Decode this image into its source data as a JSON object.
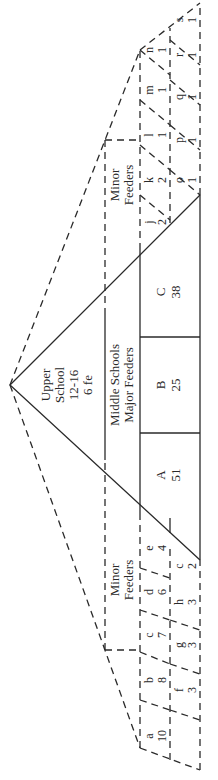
{
  "diagram": {
    "upper_school": {
      "lines": [
        "Upper",
        "School",
        "12-16",
        "6 fe"
      ]
    },
    "middle_schools": {
      "lines": [
        "Middle Schools",
        "Major Feeders"
      ],
      "feeders": [
        {
          "letter": "A",
          "value": "51"
        },
        {
          "letter": "B",
          "value": "25"
        },
        {
          "letter": "C",
          "value": "38"
        }
      ]
    },
    "minor_feeders_left": {
      "label_lines": [
        "Minor",
        "Feeders"
      ],
      "top_row": [
        {
          "letter": "a",
          "value": "10"
        },
        {
          "letter": "b",
          "value": "8"
        },
        {
          "letter": "c",
          "value": "7"
        },
        {
          "letter": "d",
          "value": "6"
        },
        {
          "letter": "e",
          "value": "4"
        }
      ],
      "bottom_row": [
        {
          "letter": "f",
          "value": "3"
        },
        {
          "letter": "g",
          "value": "3"
        },
        {
          "letter": "h",
          "value": "3"
        },
        {
          "letter": "c",
          "value": "2"
        }
      ]
    },
    "minor_feeders_right": {
      "label_lines": [
        "Minor",
        "Feeders"
      ],
      "top_row": [
        {
          "letter": "j",
          "value": "2"
        },
        {
          "letter": "k",
          "value": "2"
        },
        {
          "letter": "l",
          "value": "1"
        },
        {
          "letter": "m",
          "value": "1"
        },
        {
          "letter": "n",
          "value": "1"
        }
      ],
      "bottom_row": [
        {
          "letter": "o",
          "value": "1"
        },
        {
          "letter": "p",
          "value": "1"
        },
        {
          "letter": "q",
          "value": "1"
        },
        {
          "letter": "r",
          "value": "1"
        },
        {
          "letter": "s",
          "value": "1"
        }
      ]
    }
  }
}
